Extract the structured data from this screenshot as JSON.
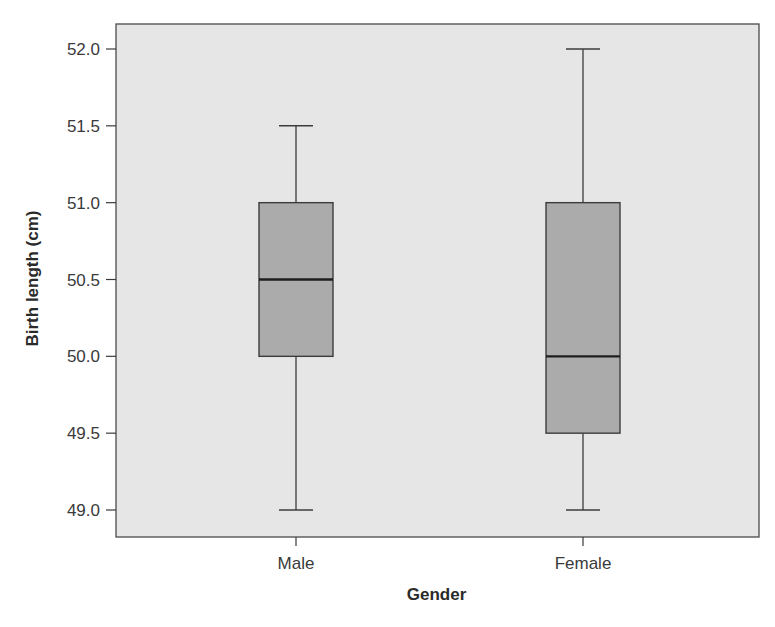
{
  "chart_data": {
    "type": "boxplot",
    "title": "",
    "xlabel": "Gender",
    "ylabel": "Birth length (cm)",
    "ylim": [
      48.83,
      52.16
    ],
    "yticks": [
      49.0,
      49.5,
      50.0,
      50.5,
      51.0,
      51.5,
      52.0
    ],
    "ytick_labels": [
      "49.0",
      "49.5",
      "50.0",
      "50.5",
      "51.0",
      "51.5",
      "52.0"
    ],
    "grid": false,
    "legend": null,
    "categories": [
      "Male",
      "Female"
    ],
    "series": [
      {
        "name": "Male",
        "min": 49.0,
        "q1": 50.0,
        "median": 50.5,
        "q3": 51.0,
        "max": 51.5
      },
      {
        "name": "Female",
        "min": 49.0,
        "q1": 49.5,
        "median": 50.0,
        "q3": 51.0,
        "max": 52.0
      }
    ],
    "colors": {
      "plot_background": "#e6e6e6",
      "box_fill": "#ababab",
      "line": "#3c3c3c",
      "median": "#1e1e1e"
    }
  }
}
